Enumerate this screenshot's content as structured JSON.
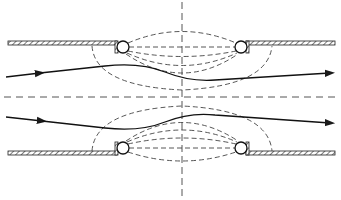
{
  "diagram": {
    "colors": {
      "background": "#ffffff",
      "line": "#1a1a1a",
      "dashed": "#3a3a3a",
      "hatch": "#444444"
    },
    "elements": {
      "walls": [
        {
          "name": "top-left-wall",
          "x1": 8,
          "x2": 117,
          "y": 42
        },
        {
          "name": "top-right-wall",
          "x1": 247,
          "x2": 335,
          "y": 42
        },
        {
          "name": "bottom-left-wall",
          "x1": 8,
          "x2": 117,
          "y": 152
        },
        {
          "name": "bottom-right-wall",
          "x1": 247,
          "x2": 335,
          "y": 152
        }
      ],
      "coils": [
        {
          "name": "top-left-coil",
          "cx": 123,
          "cy": 47,
          "r": 6
        },
        {
          "name": "top-right-coil",
          "cx": 241,
          "cy": 47,
          "r": 6
        },
        {
          "name": "bottom-left-coil",
          "cx": 123,
          "cy": 148,
          "r": 6
        },
        {
          "name": "bottom-right-coil",
          "cx": 241,
          "cy": 148,
          "r": 6
        }
      ],
      "axes": {
        "horizontal_center_y": 97,
        "vertical_center_x": 182
      },
      "rays": [
        {
          "name": "upper-ray",
          "direction": "left-to-right",
          "arrows": 2
        },
        {
          "name": "lower-ray",
          "direction": "left-to-right",
          "arrows": 2
        }
      ]
    }
  }
}
